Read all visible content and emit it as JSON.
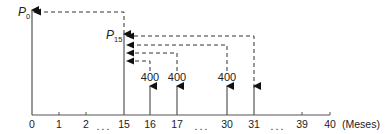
{
  "diagram": {
    "type": "cash-flow-timeline",
    "axis": {
      "unit_label": "(Meses)",
      "ticks": [
        {
          "label": "0",
          "x": 32
        },
        {
          "label": "1",
          "x": 59
        },
        {
          "label": "2",
          "x": 86
        },
        {
          "label": "...",
          "x": 104,
          "ellipsis": true
        },
        {
          "label": "15",
          "x": 124
        },
        {
          "label": "16",
          "x": 150
        },
        {
          "label": "17",
          "x": 177
        },
        {
          "label": "...",
          "x": 202,
          "ellipsis": true
        },
        {
          "label": "30",
          "x": 227
        },
        {
          "label": "31",
          "x": 254
        },
        {
          "label": "...",
          "x": 278,
          "ellipsis": true
        },
        {
          "label": "39",
          "x": 302
        },
        {
          "label": "40",
          "x": 330
        }
      ]
    },
    "present_values": [
      {
        "label": "P",
        "subscript": "0",
        "period": 0
      },
      {
        "label": "P",
        "subscript": "15",
        "period": 15
      }
    ],
    "cash_flows": [
      {
        "period": 16,
        "amount": "400",
        "labeled": true
      },
      {
        "period": 17,
        "amount": "400",
        "labeled": true
      },
      {
        "period": 30,
        "amount": "400",
        "labeled": true
      },
      {
        "period": 31,
        "amount": "",
        "labeled": false
      }
    ]
  }
}
